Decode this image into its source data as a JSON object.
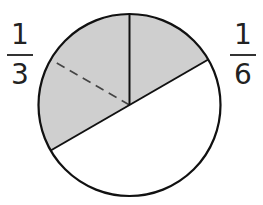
{
  "diagram": {
    "type": "fraction-circle",
    "colors": {
      "shaded": "#cfcfcf",
      "outline": "#111111",
      "unshaded": "#ffffff"
    },
    "circle": {
      "cx": 129.5,
      "cy": 105,
      "r": 91
    },
    "sectors": [
      {
        "name": "one-sixth-shaded",
        "start_deg": 90,
        "end_deg": 30,
        "shaded": true
      },
      {
        "name": "one-third-shaded",
        "start_deg": 90,
        "end_deg": 210,
        "shaded": true,
        "dashed_divider_deg": 150
      },
      {
        "name": "unshaded-half",
        "start_deg": 210,
        "end_deg": 390,
        "shaded": false
      }
    ]
  },
  "labels": {
    "left": {
      "numerator": "1",
      "denominator": "3"
    },
    "right": {
      "numerator": "1",
      "denominator": "6"
    }
  }
}
